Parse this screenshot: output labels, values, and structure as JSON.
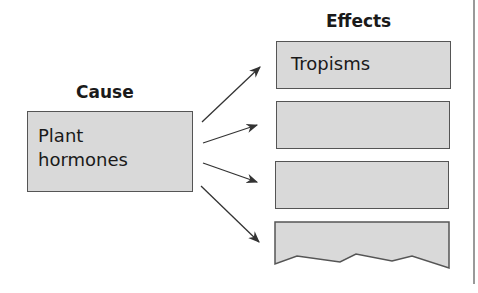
{
  "diagram": {
    "type": "cause-effect",
    "cause": {
      "heading": "Cause",
      "label_line1": "Plant",
      "label_line2": "hormones"
    },
    "effects": {
      "heading": "Effects",
      "items": [
        {
          "label": "Tropisms"
        },
        {
          "label": ""
        },
        {
          "label": ""
        },
        {
          "label": ""
        }
      ]
    },
    "colors": {
      "box_fill": "#d9d9d9",
      "box_border": "#555555",
      "arrow": "#333333",
      "divider": "#999999"
    }
  }
}
